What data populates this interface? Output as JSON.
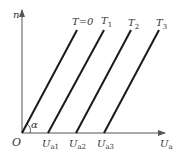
{
  "diagram": {
    "y_axis_label": "n",
    "x_axis_label": "U",
    "x_axis_label_sub": "a",
    "origin_label": "O",
    "angle_label": "α",
    "lines": [
      {
        "label": "T=0",
        "label_sub": "",
        "x0_label": "",
        "x0_sub": ""
      },
      {
        "label": "T",
        "label_sub": "1",
        "x0_label": "U",
        "x0_sub": "a1"
      },
      {
        "label": "T",
        "label_sub": "2",
        "x0_label": "U",
        "x0_sub": "a2"
      },
      {
        "label": "T",
        "label_sub": "3",
        "x0_label": "U",
        "x0_sub": "a3"
      }
    ],
    "colors": {
      "lines": "#1a1a1a",
      "axes": "#555555",
      "text": "#333333"
    }
  }
}
